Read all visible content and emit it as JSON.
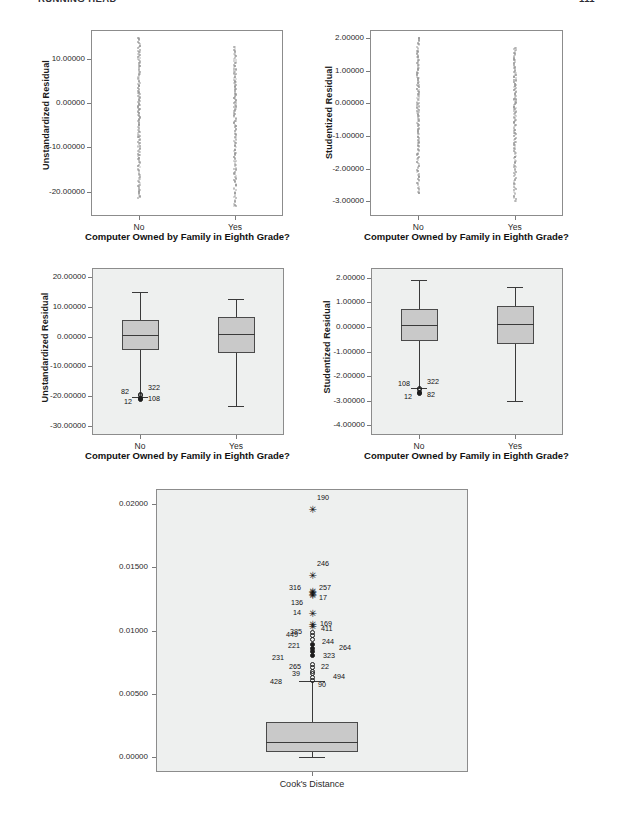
{
  "header": {
    "left": "RUNNING HEAD",
    "right": "111"
  },
  "charts": [
    {
      "id": "unstandardized-residual-scatter",
      "kind": "scatter",
      "ylabel": "Unstandardized Residual",
      "xlabel": "Computer Owned by Family in Eighth Grade?",
      "yticks": [
        "10.00000",
        "0.00000",
        "-10.00000",
        "-20.00000"
      ],
      "xticks": [
        "No",
        "Yes"
      ],
      "shaded": false
    },
    {
      "id": "studentized-residual-scatter",
      "kind": "scatter",
      "ylabel": "Studentized Residual",
      "xlabel": "Computer Owned by Family in Eighth Grade?",
      "yticks": [
        "2.00000",
        "1.00000",
        "0.00000",
        "-1.00000",
        "-2.00000",
        "-3.00000"
      ],
      "xticks": [
        "No",
        "Yes"
      ],
      "shaded": false
    },
    {
      "id": "unstandardized-residual-boxplot",
      "kind": "boxplot",
      "ylabel": "Unstandardized Residual",
      "xlabel": "Computer Owned by Family in Eighth Grade?",
      "yticks": [
        "20.00000",
        "10.00000",
        "0.00000",
        "-10.00000",
        "-20.00000",
        "-30.00000"
      ],
      "xticks": [
        "No",
        "Yes"
      ],
      "shaded": true,
      "outlier_labels": [
        "82",
        "322",
        "12",
        "108"
      ]
    },
    {
      "id": "studentized-residual-boxplot",
      "kind": "boxplot",
      "ylabel": "Studentized Residual",
      "xlabel": "Computer Owned by Family in Eighth Grade?",
      "yticks": [
        "2.00000",
        "1.00000",
        "0.00000",
        "-1.00000",
        "-2.00000",
        "-3.00000",
        "-4.00000"
      ],
      "xticks": [
        "No",
        "Yes"
      ],
      "shaded": true,
      "outlier_labels": [
        "108",
        "322",
        "12",
        "82"
      ]
    },
    {
      "id": "cooks-distance-boxplot",
      "kind": "boxplot",
      "ylabel": "",
      "xlabel": "",
      "yticks": [
        "0.02000",
        "0.01500",
        "0.01000",
        "0.00500",
        "0.00000"
      ],
      "xticks": [
        "Cook's Distance"
      ],
      "shaded": true,
      "outlier_labels": [
        "190",
        "246",
        "316",
        "257",
        "17",
        "136",
        "14",
        "169",
        "385",
        "411",
        "449",
        "244",
        "221",
        "264",
        "323",
        "231",
        "265",
        "22",
        "39",
        "494",
        "428",
        "90"
      ]
    }
  ],
  "chart_data": [
    {
      "type": "scatter",
      "title": "",
      "xlabel": "Computer Owned by Family in Eighth Grade?",
      "ylabel": "Unstandardized Residual",
      "categories": [
        "No",
        "Yes"
      ],
      "ytick_labels": [
        "10.00000",
        "0.00000",
        "-10.00000",
        "-20.00000"
      ],
      "ytick_values": [
        10,
        0,
        -10,
        -20
      ],
      "ylim": [
        -25.5,
        16.5
      ],
      "grid": false,
      "legend": "none",
      "series": [
        {
          "name": "No",
          "x_category": "No",
          "y_range": [
            -21.5,
            14.8
          ],
          "n_visible": 120,
          "values": [
            14.8,
            13.0,
            11.6,
            11.1,
            10.4,
            9.6,
            9.0,
            8.4,
            7.7,
            7.1,
            6.5,
            6.0,
            5.4,
            4.9,
            4.3,
            3.8,
            3.3,
            2.8,
            2.3,
            1.8,
            1.3,
            0.9,
            0.4,
            0.0,
            -0.4,
            -0.9,
            -1.3,
            -1.8,
            -2.3,
            -2.8,
            -3.3,
            -3.8,
            -4.3,
            -4.9,
            -5.4,
            -6.0,
            -6.5,
            -7.1,
            -7.7,
            -8.4,
            -9.0,
            -9.6,
            -10.3,
            -11.0,
            -11.7,
            -12.5,
            -13.3,
            -14.2,
            -15.2,
            -16.2,
            -17.4,
            -18.6,
            -19.9,
            -21.0
          ]
        },
        {
          "name": "Yes",
          "x_category": "Yes",
          "y_range": [
            -23.3,
            12.6
          ],
          "n_visible": 120,
          "values": [
            12.6,
            11.5,
            10.6,
            9.8,
            9.1,
            8.4,
            7.7,
            7.1,
            6.5,
            5.9,
            5.3,
            4.8,
            4.2,
            3.7,
            3.1,
            2.6,
            2.1,
            1.6,
            1.1,
            0.6,
            0.1,
            -0.4,
            -0.9,
            -1.4,
            -1.9,
            -2.4,
            -2.9,
            -3.5,
            -4.0,
            -4.6,
            -5.2,
            -5.8,
            -6.4,
            -7.0,
            -7.7,
            -8.3,
            -9.0,
            -9.7,
            -10.5,
            -11.3,
            -12.1,
            -13.0,
            -13.9,
            -14.9,
            -16.0,
            -17.2,
            -18.6,
            -20.2,
            -23.3
          ]
        }
      ]
    },
    {
      "type": "scatter",
      "title": "",
      "xlabel": "Computer Owned by Family in Eighth Grade?",
      "ylabel": "Studentized Residual",
      "categories": [
        "No",
        "Yes"
      ],
      "ytick_labels": [
        "2.00000",
        "1.00000",
        "0.00000",
        "-1.00000",
        "-2.00000",
        "-3.00000"
      ],
      "ytick_values": [
        2,
        1,
        0,
        -1,
        -2,
        -3
      ],
      "ylim": [
        -3.45,
        2.25
      ],
      "grid": false,
      "legend": "none",
      "series": [
        {
          "name": "No",
          "x_category": "No",
          "y_range": [
            -2.75,
            2.02
          ],
          "n_visible": 120,
          "values": [
            2.02,
            1.83,
            1.62,
            1.52,
            1.43,
            1.34,
            1.25,
            1.17,
            1.09,
            1.01,
            0.93,
            0.86,
            0.78,
            0.71,
            0.64,
            0.57,
            0.5,
            0.43,
            0.36,
            0.29,
            0.22,
            0.16,
            0.09,
            0.02,
            -0.05,
            -0.12,
            -0.19,
            -0.26,
            -0.33,
            -0.4,
            -0.47,
            -0.55,
            -0.62,
            -0.7,
            -0.78,
            -0.86,
            -0.95,
            -1.04,
            -1.13,
            -1.22,
            -1.32,
            -1.43,
            -1.54,
            -1.66,
            -1.79,
            -1.93,
            -2.08,
            -2.25,
            -2.45,
            -2.75
          ]
        },
        {
          "name": "Yes",
          "x_category": "Yes",
          "y_range": [
            -2.98,
            1.71
          ],
          "n_visible": 120,
          "values": [
            1.71,
            1.56,
            1.44,
            1.34,
            1.25,
            1.17,
            1.09,
            1.01,
            0.94,
            0.87,
            0.8,
            0.73,
            0.66,
            0.6,
            0.53,
            0.47,
            0.4,
            0.34,
            0.28,
            0.22,
            0.15,
            0.09,
            0.03,
            -0.03,
            -0.1,
            -0.16,
            -0.23,
            -0.3,
            -0.37,
            -0.44,
            -0.51,
            -0.58,
            -0.66,
            -0.74,
            -0.82,
            -0.9,
            -0.99,
            -1.08,
            -1.18,
            -1.28,
            -1.39,
            -1.51,
            -1.64,
            -1.78,
            -1.94,
            -2.12,
            -2.35,
            -2.47,
            -2.98
          ]
        }
      ]
    },
    {
      "type": "boxplot",
      "title": "",
      "xlabel": "Computer Owned by Family in Eighth Grade?",
      "ylabel": "Unstandardized Residual",
      "categories": [
        "No",
        "Yes"
      ],
      "ytick_labels": [
        "20.00000",
        "10.00000",
        "0.00000",
        "-10.00000",
        "-20.00000",
        "-30.00000"
      ],
      "ytick_values": [
        20,
        10,
        0,
        -10,
        -20,
        -30
      ],
      "ylim": [
        -33.0,
        23.0
      ],
      "grid": false,
      "legend": "none",
      "boxes": [
        {
          "category": "No",
          "whisker_low": -20.2,
          "q1": -4.5,
          "median": 0.4,
          "q3": 5.7,
          "whisker_high": 14.9,
          "outliers": [
            {
              "label": "322",
              "value": -19.3,
              "marker": "circle-open"
            },
            {
              "label": "82",
              "value": -19.8,
              "marker": "circle-open"
            },
            {
              "label": "108",
              "value": -20.6,
              "marker": "circle-filled"
            },
            {
              "label": "12",
              "value": -21.0,
              "marker": "circle-filled"
            }
          ]
        },
        {
          "category": "Yes",
          "whisker_low": -23.3,
          "q1": -5.5,
          "median": 1.0,
          "q3": 6.6,
          "whisker_high": 12.6,
          "outliers": []
        }
      ]
    },
    {
      "type": "boxplot",
      "title": "",
      "xlabel": "Computer Owned by Family in Eighth Grade?",
      "ylabel": "Studentized Residual",
      "categories": [
        "No",
        "Yes"
      ],
      "ytick_labels": [
        "2.00000",
        "1.00000",
        "0.00000",
        "-1.00000",
        "-2.00000",
        "-3.00000",
        "-4.00000"
      ],
      "ytick_values": [
        2,
        1,
        0,
        -1,
        -2,
        -3,
        -4
      ],
      "ylim": [
        -4.4,
        2.4
      ],
      "grid": false,
      "legend": "none",
      "boxes": [
        {
          "category": "No",
          "whisker_low": -2.47,
          "q1": -0.58,
          "median": 0.06,
          "q3": 0.74,
          "whisker_high": 1.9,
          "outliers": [
            {
              "label": "322",
              "value": -2.5,
              "marker": "circle-open"
            },
            {
              "label": "108",
              "value": -2.54,
              "marker": "circle-open"
            },
            {
              "label": "82",
              "value": -2.68,
              "marker": "circle-filled"
            },
            {
              "label": "12",
              "value": -2.72,
              "marker": "circle-filled"
            }
          ]
        },
        {
          "category": "Yes",
          "whisker_low": -3.02,
          "q1": -0.69,
          "median": 0.11,
          "q3": 0.87,
          "whisker_high": 1.64,
          "outliers": []
        }
      ]
    },
    {
      "type": "boxplot",
      "title": "",
      "xlabel": "",
      "ylabel": "",
      "categories": [
        "Cook's Distance"
      ],
      "ytick_labels": [
        "0.02000",
        "0.01500",
        "0.01000",
        "0.00500",
        "0.00000"
      ],
      "ytick_values": [
        0.02,
        0.015,
        0.01,
        0.005,
        0.0
      ],
      "ylim": [
        -0.0012,
        0.0212
      ],
      "grid": false,
      "legend": "none",
      "boxes": [
        {
          "category": "Cook's Distance",
          "whisker_low": 2e-05,
          "q1": 0.00038,
          "median": 0.0012,
          "q3": 0.00272,
          "whisker_high": 0.006,
          "outliers": [
            {
              "label": "190",
              "value": 0.01955,
              "marker": "star"
            },
            {
              "label": "246",
              "value": 0.01432,
              "marker": "star"
            },
            {
              "label": "316",
              "value": 0.01305,
              "marker": "star"
            },
            {
              "label": "257",
              "value": 0.013,
              "marker": "star"
            },
            {
              "label": "17",
              "value": 0.01278,
              "marker": "star"
            },
            {
              "label": "136",
              "value": 0.01272,
              "marker": "star"
            },
            {
              "label": "14",
              "value": 0.01128,
              "marker": "star"
            },
            {
              "label": "169",
              "value": 0.01045,
              "marker": "star"
            },
            {
              "label": "385",
              "value": 0.01028,
              "marker": "star"
            },
            {
              "label": "411",
              "value": 0.00988,
              "marker": "circle-open"
            },
            {
              "label": "449",
              "value": 0.00958,
              "marker": "circle-open"
            },
            {
              "label": "244",
              "value": 0.00928,
              "marker": "circle-open"
            },
            {
              "label": "221",
              "value": 0.00888,
              "marker": "circle-filled"
            },
            {
              "label": "264",
              "value": 0.00855,
              "marker": "circle-filled"
            },
            {
              "label": "323",
              "value": 0.0083,
              "marker": "circle-filled"
            },
            {
              "label": "231",
              "value": 0.008,
              "marker": "circle-filled"
            },
            {
              "label": "265",
              "value": 0.00728,
              "marker": "circle-open"
            },
            {
              "label": "22",
              "value": 0.0071,
              "marker": "circle-open"
            },
            {
              "label": "39",
              "value": 0.00678,
              "marker": "circle-open"
            },
            {
              "label": "494",
              "value": 0.0066,
              "marker": "circle-open"
            },
            {
              "label": "428",
              "value": 0.00625,
              "marker": "circle-open"
            },
            {
              "label": "90",
              "value": 0.00605,
              "marker": "circle-open"
            }
          ]
        }
      ]
    }
  ]
}
